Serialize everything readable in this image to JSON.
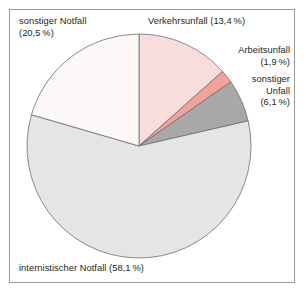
{
  "figure": {
    "title": "",
    "frame_color": "#9a9a9a",
    "background": "#ffffff"
  },
  "chart_data": {
    "type": "pie",
    "title": "",
    "xlabel": "",
    "ylabel": "",
    "legend_position": "none",
    "grid": false,
    "start_angle_deg": 0,
    "direction": "clockwise",
    "center": {
      "x": 139,
      "y": 146
    },
    "radius": 112,
    "categories": [
      "Verkehrsunfall",
      "Arbeitsunfall",
      "sonstiger Unfall",
      "internistischer Notfall",
      "sonstiger Notfall"
    ],
    "values": [
      13.4,
      1.9,
      6.1,
      58.1,
      20.5
    ],
    "value_suffix": "%",
    "colors": [
      "#f9dcdc",
      "#f0a39a",
      "#a8a8a8",
      "#e4e6e3",
      "#fbf8f7"
    ],
    "slice_border_color": "#6e6e6e",
    "slices": [
      {
        "label": "Verkehrsunfall",
        "value": 13.4,
        "value_text": "13,4 %",
        "color": "#f9dcdc"
      },
      {
        "label": "Arbeitsunfall",
        "value": 1.9,
        "value_text": "1,9 %",
        "color": "#f0a39a"
      },
      {
        "label": "sonstiger Unfall",
        "value": 6.1,
        "value_text": "6,1 %",
        "color": "#a8a8a8"
      },
      {
        "label": "internistischer Notfall",
        "value": 58.1,
        "value_text": "58,1 %",
        "color": "#e4e6e3"
      },
      {
        "label": "sonstiger Notfall",
        "value": 20.5,
        "value_text": "20,5 %",
        "color": "#fbf8f7"
      }
    ]
  },
  "labels": {
    "sonstiger_notfall": "sonstiger Notfall\n(20,5 %)",
    "verkehrsunfall": "Verkehrsunfall (13,4 %)",
    "arbeitsunfall": "Arbeitsunfall\n(1,9 %)",
    "sonstiger_unfall": "sonstiger\nUnfall\n(6,1 %)",
    "internistischer_notfall": "internistischer Notfall (58,1 %)"
  }
}
